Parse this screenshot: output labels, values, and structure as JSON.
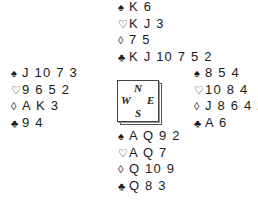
{
  "suit_symbols": {
    "spades": "♠",
    "hearts": "♡",
    "diamonds": "◊",
    "clubs": "♣"
  },
  "compass": {
    "north": "N",
    "south": "S",
    "east": "E",
    "west": "W"
  },
  "hands": {
    "north": {
      "spades": "K 6",
      "hearts": "K J 3",
      "diamonds": "7 5",
      "clubs": "K J 10 7 5 2"
    },
    "west": {
      "spades": "J 10 7 3",
      "hearts": "9 6 5 2",
      "diamonds": "A K 3",
      "clubs": "9 4"
    },
    "east": {
      "spades": "8 5 4",
      "hearts": "10 8 4",
      "diamonds": "J 8 6 4 2",
      "clubs": "A 6"
    },
    "south": {
      "spades": "A Q 9 2",
      "hearts": "A Q 7",
      "diamonds": "Q 10 9",
      "clubs": "Q 8 3"
    }
  }
}
